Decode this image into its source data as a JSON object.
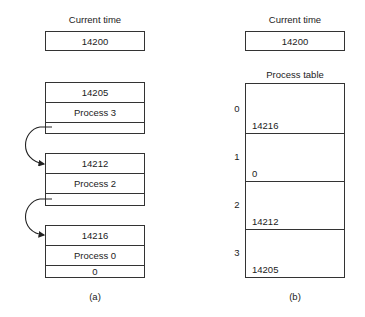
{
  "panel_a": {
    "current_time_label": "Current time",
    "current_time_value": "14200",
    "queue": [
      {
        "time": "14205",
        "process": "Process 3",
        "next": ""
      },
      {
        "time": "14212",
        "process": "Process 2",
        "next": ""
      },
      {
        "time": "14216",
        "process": "Process 0",
        "next": "0"
      }
    ],
    "caption": "(a)"
  },
  "panel_b": {
    "current_time_label": "Current time",
    "current_time_value": "14200",
    "table_title": "Process table",
    "entries": [
      {
        "index": "0",
        "value": "14216"
      },
      {
        "index": "1",
        "value": "0"
      },
      {
        "index": "2",
        "value": "14212"
      },
      {
        "index": "3",
        "value": "14205"
      }
    ],
    "caption": "(b)"
  }
}
